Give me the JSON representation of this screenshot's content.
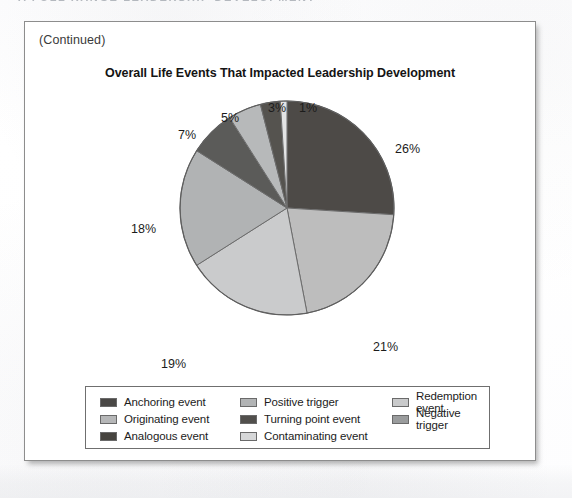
{
  "page": {
    "running_head": "A FULL RANGE LEADERSHIP DEVELOPMENT",
    "continued_label": "(Continued)"
  },
  "figure": {
    "title": "Overall Life Events That Impacted Leadership Development"
  },
  "chart_data": {
    "type": "pie",
    "title": "Overall Life Events That Impacted Leadership Development",
    "xlabel": "",
    "ylabel": "",
    "start_angle_deg": 0,
    "direction": "clockwise",
    "legend_position": "bottom",
    "grid": false,
    "categories": [
      "Anchoring event",
      "Originating event",
      "Analogous event",
      "Positive trigger",
      "Turning point event",
      "Contaminating event",
      "Redemption event",
      "Negative trigger"
    ],
    "values": [
      26,
      21,
      19,
      18,
      7,
      5,
      3,
      1
    ],
    "labels": [
      "26%",
      "21%",
      "19%",
      "18%",
      "7%",
      "5%",
      "3%",
      "1%"
    ],
    "colors": [
      "#4d4a47",
      "#bdbdbd",
      "#cacbcc",
      "#b1b3b4",
      "#5b5b59",
      "#b7b9ba",
      "#55534f",
      "#e3e4e5"
    ],
    "slices": [
      {
        "label": "26%",
        "value": 26,
        "color": "#4d4a47",
        "category": "Anchoring event"
      },
      {
        "label": "21%",
        "value": 21,
        "color": "#bdbdbd",
        "category": "Originating event"
      },
      {
        "label": "19%",
        "value": 19,
        "color": "#cacbcc",
        "category": "Analogous event"
      },
      {
        "label": "18%",
        "value": 18,
        "color": "#b1b3b4",
        "category": "Positive trigger"
      },
      {
        "label": "7%",
        "value": 7,
        "color": "#5b5b59",
        "category": "Turning point event"
      },
      {
        "label": "5%",
        "value": 5,
        "color": "#b7b9ba",
        "category": "Contaminating event"
      },
      {
        "label": "3%",
        "value": 3,
        "color": "#55534f",
        "category": "Redemption event"
      },
      {
        "label": "1%",
        "value": 1,
        "color": "#e3e4e5",
        "category": "Negative trigger"
      }
    ]
  },
  "legend": {
    "items": [
      {
        "label": "Anchoring event",
        "color": "#4a4846"
      },
      {
        "label": "Positive trigger",
        "color": "#b2b4b5"
      },
      {
        "label": "Redemption event",
        "color": "#c9cacb"
      },
      {
        "label": "Originating event",
        "color": "#b6b7b8"
      },
      {
        "label": "Turning point event",
        "color": "#514f4c"
      },
      {
        "label": "Negative trigger",
        "color": "#9a9c9d"
      },
      {
        "label": "Analogous event",
        "color": "#46443f"
      },
      {
        "label": "Contaminating event",
        "color": "#d6d7d8"
      }
    ]
  }
}
